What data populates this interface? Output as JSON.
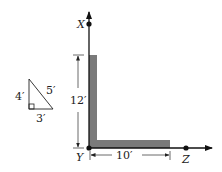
{
  "diagram": {
    "axes": {
      "vertical_label": "X",
      "origin_label": "Y",
      "horizontal_label": "Z"
    },
    "dimensions": {
      "vertical": "12′",
      "horizontal": "10′"
    },
    "slope_triangle": {
      "vertical_side": "4′",
      "hypotenuse": "5′",
      "horizontal_side": "3′"
    },
    "colors": {
      "member_fill": "#7a7a7a",
      "line": "#111111"
    }
  }
}
